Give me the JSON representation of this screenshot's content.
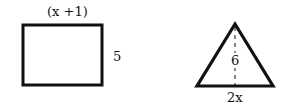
{
  "rectangle": {
    "top_label": "(x +1)",
    "side_label": "5"
  },
  "triangle": {
    "height_label": "6",
    "base_label": "2x"
  }
}
